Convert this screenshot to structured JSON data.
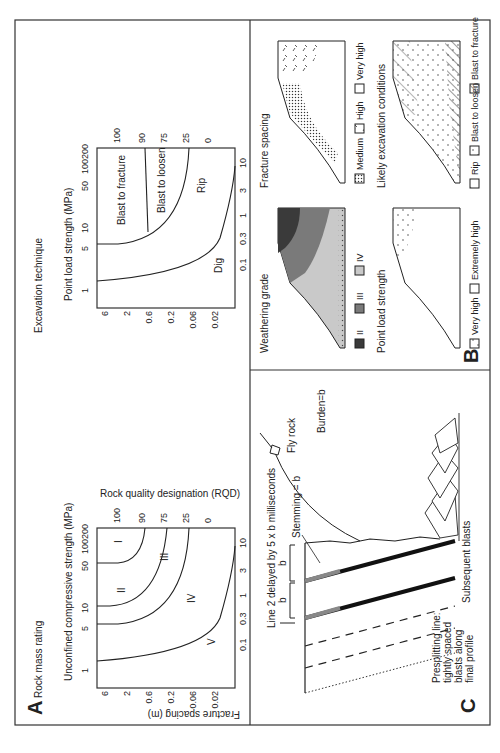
{
  "figure": {
    "panels": {
      "A": {
        "label": "A",
        "rock_mass_chart": {
          "title": "Rock mass rating",
          "top_axis_label": "Unconfined compressive strength (MPa)",
          "top_ticks": [
            "1",
            "5",
            "10",
            "50",
            "100",
            "200"
          ],
          "bottom_axis_label": "Point load strength (MPa)",
          "bottom_ticks": [
            "0.1",
            "0.3",
            "1",
            "3",
            "10"
          ],
          "left_axis_label": "Fracture spacing (m)",
          "left_ticks": [
            "6",
            "2",
            "0.6",
            "0.2",
            "0.06",
            "0.02"
          ],
          "right_axis_label": "Rock quality designation (RQD)",
          "right_ticks": [
            "100",
            "90",
            "75",
            "25",
            "0"
          ],
          "zones": [
            "I",
            "II",
            "III",
            "IV",
            "V"
          ]
        },
        "excavation_chart": {
          "title": "Excavation technique",
          "top_axis_label": "Point load strength (MPa)",
          "top_ticks": [
            "1",
            "5",
            "10",
            "50",
            "100",
            "200"
          ],
          "bottom_ticks": [
            "0.1",
            "0.3",
            "1",
            "3",
            "10"
          ],
          "left_ticks": [
            "6",
            "2",
            "0.6",
            "0.2",
            "0.06",
            "0.02"
          ],
          "right_ticks": [
            "100",
            "90",
            "75",
            "25",
            "0"
          ],
          "zones": [
            "Blast to fracture",
            "Blast to loosen",
            "Rip",
            "Dig"
          ]
        }
      },
      "B": {
        "label": "B",
        "maps": [
          {
            "title": "Weathering grade",
            "legend": [
              "II",
              "III",
              "IV"
            ]
          },
          {
            "title": "Fracture spacing",
            "legend": [
              "Medium",
              "High",
              "Very high"
            ]
          },
          {
            "title": "Point load strength",
            "legend": [
              "Very high",
              "Extremely high"
            ]
          },
          {
            "title": "Likely excavation conditions",
            "legend": [
              "Rip",
              "Blast to loosen",
              "Blast to fracture"
            ]
          }
        ]
      },
      "C": {
        "label": "C",
        "annotations": {
          "line2": "Line 2 delayed by 5 x b milliseconds",
          "stemming": "Stemming = b",
          "fly_rock": "Fly rock",
          "burden": "Burden=b",
          "b1": "b",
          "b2": "b",
          "subsequent": "Subsequent blasts",
          "presplit": [
            "Presplitting line:",
            "tightly spaced",
            "blasts along",
            "final profile"
          ]
        }
      }
    }
  }
}
